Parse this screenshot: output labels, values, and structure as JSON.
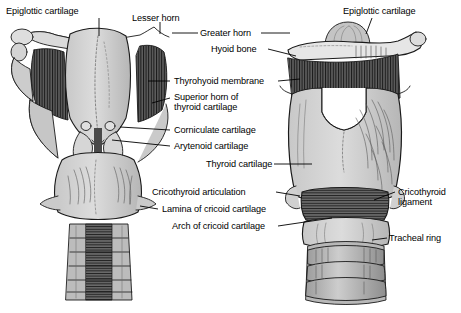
{
  "figure": {
    "background_color": "#ffffff",
    "ink_color": "#000000",
    "fill_light": "#d2d2d2",
    "fill_mid": "#a8a8a8",
    "fill_dark": "#6d6d6d"
  },
  "views": {
    "left": {
      "name": "posterior-view-larynx"
    },
    "right": {
      "name": "anterior-view-larynx"
    }
  },
  "labels": [
    {
      "id": "epiglottic-cartilage-left",
      "text": "Epiglottic cartilage",
      "x": 6,
      "y": 6,
      "align": "left"
    },
    {
      "id": "lesser-horn",
      "text": "Lesser horn",
      "x": 132,
      "y": 13,
      "align": "left"
    },
    {
      "id": "greater-horn",
      "text": "Greater horn",
      "x": 200,
      "y": 29,
      "align": "left"
    },
    {
      "id": "hyoid-bone",
      "text": "Hyoid bone",
      "x": 211,
      "y": 45,
      "align": "left"
    },
    {
      "id": "thyrohyoid-membrane",
      "text": "Thyrohyoid membrane",
      "x": 172,
      "y": 77,
      "align": "left"
    },
    {
      "id": "superior-horn-thyroid",
      "text": "Superior horn of",
      "x": 172,
      "y": 93,
      "align": "left"
    },
    {
      "id": "superior-horn-thyroid-2",
      "text": "thyroid cartilage",
      "x": 172,
      "y": 103,
      "align": "left"
    },
    {
      "id": "corniculate-cartilage",
      "text": "Corniculate cartilage",
      "x": 172,
      "y": 126,
      "align": "left"
    },
    {
      "id": "arytenoid-cartilage",
      "text": "Arytenoid cartilage",
      "x": 172,
      "y": 142,
      "align": "left"
    },
    {
      "id": "thyroid-cartilage",
      "text": "Thyroid cartilage",
      "x": 206,
      "y": 160,
      "align": "left"
    },
    {
      "id": "cricothyroid-articulation",
      "text": "Cricothyroid articulation",
      "x": 178,
      "y": 188,
      "align": "left"
    },
    {
      "id": "lamina-cricoid-cartilage",
      "text": "Lamina of cricoid cartilage",
      "x": 160,
      "y": 205,
      "align": "left"
    },
    {
      "id": "arch-cricoid-cartilage",
      "text": "Arch of cricoid cartilage",
      "x": 170,
      "y": 222,
      "align": "left"
    },
    {
      "id": "epiglottic-cartilage-right",
      "text": "Epiglottic cartilage",
      "x": 343,
      "y": 6,
      "align": "left"
    },
    {
      "id": "cricothyroid-ligament",
      "text": "Cricothyroid",
      "x": 397,
      "y": 188,
      "align": "left"
    },
    {
      "id": "cricothyroid-ligament-2",
      "text": "ligament",
      "x": 397,
      "y": 198,
      "align": "left"
    },
    {
      "id": "tracheal-ring",
      "text": "Tracheal ring",
      "x": 389,
      "y": 234,
      "align": "left"
    }
  ]
}
